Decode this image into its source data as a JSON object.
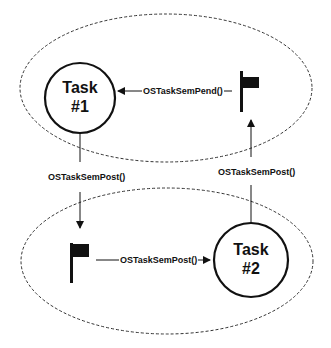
{
  "diagram": {
    "colors": {
      "stroke": "#111111",
      "background": "#ffffff",
      "ellipse_dash": "#333333"
    },
    "top_group": {
      "task": {
        "line1": "Task",
        "line2": "#1"
      },
      "flag_icon": "semaphore-flag",
      "pend_arrow_label": "OSTaskSemPend()"
    },
    "bottom_group": {
      "task": {
        "line1": "Task",
        "line2": "#2"
      },
      "flag_icon": "semaphore-flag",
      "post_arrow_label": "OSTaskSemPost()"
    },
    "cross_links": {
      "task1_to_bottom_flag_label": "OSTaskSemPost()",
      "task2_to_top_flag_label": "OSTaskSemPost()"
    }
  }
}
